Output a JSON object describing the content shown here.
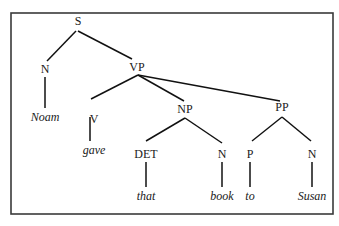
{
  "diagram": {
    "type": "syntax-tree",
    "frame": {
      "x": 11,
      "y": 13,
      "width": 322,
      "height": 201
    },
    "nodes": [
      {
        "id": "S",
        "label": "S",
        "x": 78,
        "y": 22,
        "leaf": false
      },
      {
        "id": "N1",
        "label": "N",
        "x": 45,
        "y": 70,
        "leaf": false
      },
      {
        "id": "VP",
        "label": "VP",
        "x": 137,
        "y": 68,
        "leaf": false
      },
      {
        "id": "Noam",
        "label": "Noam",
        "x": 45,
        "y": 118,
        "leaf": true
      },
      {
        "id": "V",
        "label": "V",
        "x": 94,
        "y": 120,
        "leaf": false
      },
      {
        "id": "NP",
        "label": "NP",
        "x": 185,
        "y": 110,
        "leaf": false
      },
      {
        "id": "PP",
        "label": "PP",
        "x": 282,
        "y": 108,
        "leaf": false
      },
      {
        "id": "gave",
        "label": "gave",
        "x": 94,
        "y": 151,
        "leaf": true
      },
      {
        "id": "DET",
        "label": "DET",
        "x": 146,
        "y": 155,
        "leaf": false
      },
      {
        "id": "N2",
        "label": "N",
        "x": 222,
        "y": 155,
        "leaf": false
      },
      {
        "id": "P",
        "label": "P",
        "x": 250,
        "y": 155,
        "leaf": false
      },
      {
        "id": "N3",
        "label": "N",
        "x": 312,
        "y": 155,
        "leaf": false
      },
      {
        "id": "that",
        "label": "that",
        "x": 146,
        "y": 197,
        "leaf": true
      },
      {
        "id": "book",
        "label": "book",
        "x": 222,
        "y": 197,
        "leaf": true
      },
      {
        "id": "to",
        "label": "to",
        "x": 250,
        "y": 197,
        "leaf": true
      },
      {
        "id": "Susan",
        "label": "Susan",
        "x": 312,
        "y": 197,
        "leaf": true
      }
    ],
    "edges": [
      {
        "from": "S",
        "to": "N1",
        "x1": 76,
        "y1": 31,
        "x2": 47,
        "y2": 61
      },
      {
        "from": "S",
        "to": "VP",
        "x1": 78,
        "y1": 31,
        "x2": 132,
        "y2": 59
      },
      {
        "from": "N1",
        "to": "Noam",
        "x1": 45,
        "y1": 77,
        "x2": 45,
        "y2": 108
      },
      {
        "from": "VP",
        "to": "V",
        "x1": 138,
        "y1": 75,
        "x2": 91,
        "y2": 99
      },
      {
        "from": "VP",
        "to": "NP",
        "x1": 138,
        "y1": 75,
        "x2": 184,
        "y2": 101
      },
      {
        "from": "VP",
        "to": "PP",
        "x1": 138,
        "y1": 75,
        "x2": 280,
        "y2": 101
      },
      {
        "from": "V",
        "to": "gave",
        "x1": 90,
        "y1": 117,
        "x2": 90,
        "y2": 141
      },
      {
        "from": "NP",
        "to": "DET",
        "x1": 185,
        "y1": 118,
        "x2": 146,
        "y2": 141
      },
      {
        "from": "NP",
        "to": "N2",
        "x1": 185,
        "y1": 118,
        "x2": 222,
        "y2": 143
      },
      {
        "from": "PP",
        "to": "P",
        "x1": 282,
        "y1": 117,
        "x2": 252,
        "y2": 141
      },
      {
        "from": "PP",
        "to": "N3",
        "x1": 282,
        "y1": 117,
        "x2": 311,
        "y2": 141
      },
      {
        "from": "DET",
        "to": "that",
        "x1": 146,
        "y1": 162,
        "x2": 146,
        "y2": 187
      },
      {
        "from": "N2",
        "to": "book",
        "x1": 222,
        "y1": 162,
        "x2": 222,
        "y2": 187
      },
      {
        "from": "P",
        "to": "to",
        "x1": 250,
        "y1": 162,
        "x2": 250,
        "y2": 187
      },
      {
        "from": "N3",
        "to": "Susan",
        "x1": 312,
        "y1": 162,
        "x2": 312,
        "y2": 187
      }
    ],
    "sentence": [
      "Noam",
      "gave",
      "that",
      "book",
      "to",
      "Susan"
    ]
  }
}
